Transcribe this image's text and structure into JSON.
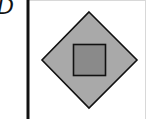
{
  "panel": {
    "label": "D"
  },
  "figure": {
    "background": "#ffffff",
    "frame": {
      "left_border_color": "#111111",
      "edge_color": "#d8d8d8"
    },
    "outer_shape": {
      "type": "diamond",
      "fill": "#a9a9a9",
      "stroke": "#111111"
    },
    "inner_shape": {
      "type": "square",
      "fill": "#8a8a8a",
      "stroke": "#111111"
    }
  }
}
